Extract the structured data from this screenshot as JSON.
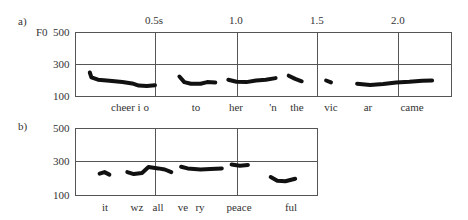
{
  "chart_data": [
    {
      "type": "scatter",
      "panel_label": "a)",
      "title": "",
      "ylabel": "F0",
      "xlabel": "",
      "ylim": [
        100,
        500
      ],
      "yticks": [
        "500",
        "300",
        "100"
      ],
      "xticks": [
        "0.5s",
        "1.0",
        "1.5",
        "2.0"
      ],
      "xlim_seconds": [
        0.0,
        2.32
      ],
      "grid": {
        "horizontal": [
          300
        ],
        "vertical": [
          0.5,
          1.0,
          1.5,
          2.0
        ]
      },
      "words": [
        "cheer i o",
        "to",
        "her",
        "'n",
        "the",
        "vic",
        "ar",
        "came"
      ],
      "series": [
        {
          "name": "cheer i o",
          "points": [
            [
              0.1,
              250
            ],
            [
              0.11,
              220
            ],
            [
              0.15,
              205
            ],
            [
              0.22,
              198
            ],
            [
              0.3,
              190
            ],
            [
              0.36,
              182
            ],
            [
              0.4,
              168
            ],
            [
              0.45,
              165
            ],
            [
              0.5,
              170
            ]
          ]
        },
        {
          "name": "to",
          "points": [
            [
              0.65,
              225
            ],
            [
              0.68,
              190
            ],
            [
              0.72,
              180
            ],
            [
              0.78,
              180
            ],
            [
              0.82,
              190
            ],
            [
              0.87,
              188
            ]
          ]
        },
        {
          "name": "her 'n",
          "points": [
            [
              0.95,
              205
            ],
            [
              1.0,
              192
            ],
            [
              1.06,
              190
            ],
            [
              1.12,
              200
            ],
            [
              1.18,
              205
            ],
            [
              1.24,
              215
            ]
          ]
        },
        {
          "name": "the",
          "points": [
            [
              1.32,
              230
            ],
            [
              1.36,
              210
            ],
            [
              1.4,
              195
            ]
          ]
        },
        {
          "name": "vic",
          "points": [
            [
              1.55,
              200
            ],
            [
              1.58,
              188
            ]
          ]
        },
        {
          "name": "ar came",
          "points": [
            [
              1.74,
              180
            ],
            [
              1.82,
              172
            ],
            [
              1.9,
              178
            ],
            [
              1.98,
              188
            ],
            [
              2.06,
              192
            ],
            [
              2.14,
              198
            ],
            [
              2.2,
              200
            ]
          ]
        }
      ]
    },
    {
      "type": "scatter",
      "panel_label": "b)",
      "title": "",
      "ylabel": "",
      "xlabel": "",
      "ylim": [
        100,
        500
      ],
      "yticks": [
        "500",
        "300",
        "100"
      ],
      "xlim_seconds": [
        0.0,
        1.5
      ],
      "grid": {
        "horizontal": [
          300
        ],
        "vertical": [
          0.5,
          1.0
        ]
      },
      "words": [
        "it",
        "wz",
        "all",
        "ve",
        "ry",
        "peace",
        "ful"
      ],
      "series": [
        {
          "name": "it",
          "points": [
            [
              0.16,
              230
            ],
            [
              0.19,
              240
            ],
            [
              0.22,
              225
            ]
          ]
        },
        {
          "name": "wz all",
          "points": [
            [
              0.33,
              240
            ],
            [
              0.37,
              228
            ],
            [
              0.42,
              235
            ],
            [
              0.46,
              270
            ],
            [
              0.52,
              262
            ],
            [
              0.56,
              255
            ],
            [
              0.6,
              240
            ]
          ]
        },
        {
          "name": "ve ry",
          "points": [
            [
              0.66,
              272
            ],
            [
              0.7,
              262
            ],
            [
              0.78,
              255
            ],
            [
              0.84,
              258
            ],
            [
              0.91,
              262
            ]
          ]
        },
        {
          "name": "peace",
          "points": [
            [
              0.97,
              285
            ],
            [
              1.02,
              278
            ],
            [
              1.07,
              282
            ]
          ]
        },
        {
          "name": "ful",
          "points": [
            [
              1.21,
              210
            ],
            [
              1.25,
              188
            ],
            [
              1.3,
              185
            ],
            [
              1.36,
              200
            ]
          ]
        }
      ]
    }
  ],
  "panel_a": {
    "label": "a)",
    "ylabel": "F0",
    "yticks": {
      "top": "500",
      "mid": "300",
      "bottom": "100"
    },
    "xticks": [
      "0.5s",
      "1.0",
      "1.5",
      "2.0"
    ],
    "words": [
      {
        "text": "cheer i o",
        "x": 130
      },
      {
        "text": "to",
        "x": 196
      },
      {
        "text": "her",
        "x": 236
      },
      {
        "text": "'n",
        "x": 273
      },
      {
        "text": "the",
        "x": 297
      },
      {
        "text": "vic",
        "x": 331
      },
      {
        "text": "ar",
        "x": 368
      },
      {
        "text": "came",
        "x": 412
      }
    ]
  },
  "panel_b": {
    "label": "b)",
    "yticks": {
      "top": "500",
      "mid": "300",
      "bottom": "100"
    },
    "words": [
      {
        "text": "it",
        "x": 105
      },
      {
        "text": "wz",
        "x": 137
      },
      {
        "text": "all",
        "x": 158
      },
      {
        "text": "ve",
        "x": 183
      },
      {
        "text": "ry",
        "x": 200
      },
      {
        "text": "peace",
        "x": 239
      },
      {
        "text": "ful",
        "x": 291
      }
    ]
  }
}
